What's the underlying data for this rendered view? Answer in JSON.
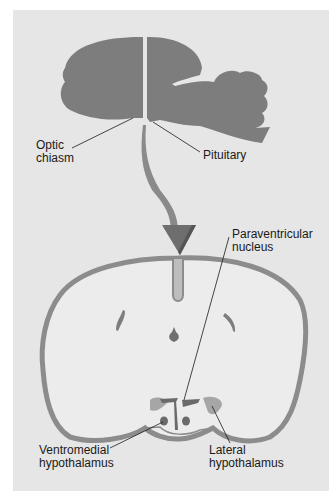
{
  "figure": {
    "title": "",
    "colors": {
      "background": "#e6e6e6",
      "tissue_dark": "#7d7d7d",
      "tissue_light": "#ececec",
      "outline": "#8c8c8c",
      "nucleus_dark": "#6a6a6a",
      "nucleus_mid": "#9a9a9a",
      "leader_line": "#1a1a1a"
    }
  },
  "labels": {
    "optic_chiasm": "Optic\nchiasm",
    "pituitary": "Pituitary",
    "paraventricular": "Paraventricular\nnucleus",
    "ventromedial": "Ventromedial\nhypothalamus",
    "lateral": "Lateral\nhypothalamus"
  }
}
